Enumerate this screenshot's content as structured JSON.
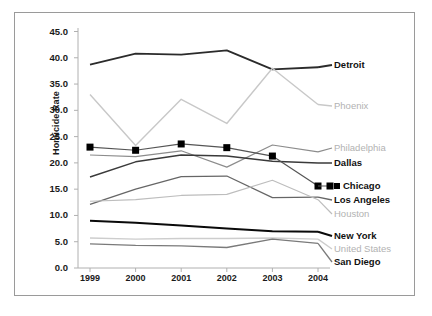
{
  "chart_data": {
    "type": "line",
    "title": "",
    "xlabel": "",
    "ylabel": "Homicide Rate",
    "x": [
      "1999",
      "2000",
      "2001",
      "2002",
      "2003",
      "2004"
    ],
    "ylim": [
      0.0,
      45.0
    ],
    "yticks": [
      "0.0",
      "5.0",
      "10.0",
      "15.0",
      "20.0",
      "25.0",
      "30.0",
      "35.0",
      "40.0",
      "45.0"
    ],
    "ytick_values": [
      0.0,
      5.0,
      10.0,
      15.0,
      20.0,
      25.0,
      30.0,
      35.0,
      40.0,
      45.0
    ],
    "grid": false,
    "legend_position": "right",
    "series": [
      {
        "name": "Detroit",
        "values": [
          38.7,
          40.8,
          40.6,
          41.4,
          37.8,
          38.2
        ],
        "color": "#2b2b2b",
        "width": 1.8,
        "marker": "none",
        "label_style": "bold"
      },
      {
        "name": "Phoenix",
        "values": [
          33.0,
          23.3,
          32.1,
          27.5,
          38.0,
          31.1
        ],
        "color": "#c8c8c8",
        "width": 1.4,
        "marker": "none",
        "label_style": "grey"
      },
      {
        "name": "Philadelphia",
        "values": [
          21.5,
          21.2,
          22.3,
          19.2,
          23.4,
          22.1
        ],
        "color": "#8c8c8c",
        "width": 1.2,
        "marker": "none",
        "label_style": "grey"
      },
      {
        "name": "Dallas",
        "values": [
          17.3,
          20.2,
          21.5,
          21.3,
          20.3,
          20.0
        ],
        "color": "#3a3a3a",
        "width": 1.5,
        "marker": "none",
        "label_style": "bold"
      },
      {
        "name": "Chicago",
        "values": [
          23.0,
          22.4,
          23.6,
          22.9,
          21.3,
          15.6
        ],
        "color": "#555555",
        "width": 1.2,
        "marker": "square",
        "label_style": "dark"
      },
      {
        "name": "Los Angeles",
        "values": [
          12.1,
          15.0,
          17.4,
          17.5,
          13.4,
          13.5
        ],
        "color": "#666666",
        "width": 1.3,
        "marker": "none",
        "label_style": "bold"
      },
      {
        "name": "Houston",
        "values": [
          12.7,
          13.0,
          13.8,
          14.0,
          16.7,
          13.0
        ],
        "color": "#bdbdbd",
        "width": 1.2,
        "marker": "none",
        "label_style": "grey"
      },
      {
        "name": "New York",
        "values": [
          9.0,
          8.6,
          8.1,
          7.5,
          7.0,
          6.9
        ],
        "color": "#0a0a0a",
        "width": 2.0,
        "marker": "none",
        "label_style": "bold"
      },
      {
        "name": "United States",
        "values": [
          5.7,
          5.5,
          5.6,
          5.6,
          5.7,
          5.5
        ],
        "color": "#cdcdcd",
        "width": 1.4,
        "marker": "none",
        "label_style": "grey"
      },
      {
        "name": "San Diego",
        "values": [
          4.6,
          4.3,
          4.2,
          3.9,
          5.5,
          4.7
        ],
        "color": "#7a7a7a",
        "width": 1.3,
        "marker": "none",
        "label_style": "bold"
      }
    ]
  },
  "legend": {
    "items": [
      {
        "label": "Detroit"
      },
      {
        "label": "Phoenix"
      },
      {
        "label": "Philadelphia"
      },
      {
        "label": "Dallas"
      },
      {
        "label": "Chicago"
      },
      {
        "label": "Los Angeles"
      },
      {
        "label": "Houston"
      },
      {
        "label": "New York"
      },
      {
        "label": "United States"
      },
      {
        "label": "San Diego"
      }
    ]
  }
}
